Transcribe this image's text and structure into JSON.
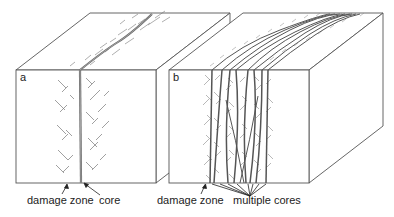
{
  "panels": [
    {
      "id": "a",
      "letter": "a",
      "labels": {
        "damage_zone": "damage zone",
        "core": "core"
      }
    },
    {
      "id": "b",
      "letter": "b",
      "labels": {
        "damage_zone": "damage zone",
        "cores": "multiple cores"
      }
    }
  ],
  "colors": {
    "outline": "#555555",
    "fault": "#666666",
    "fracture": "#777777",
    "text": "#222222",
    "background": "#ffffff"
  }
}
